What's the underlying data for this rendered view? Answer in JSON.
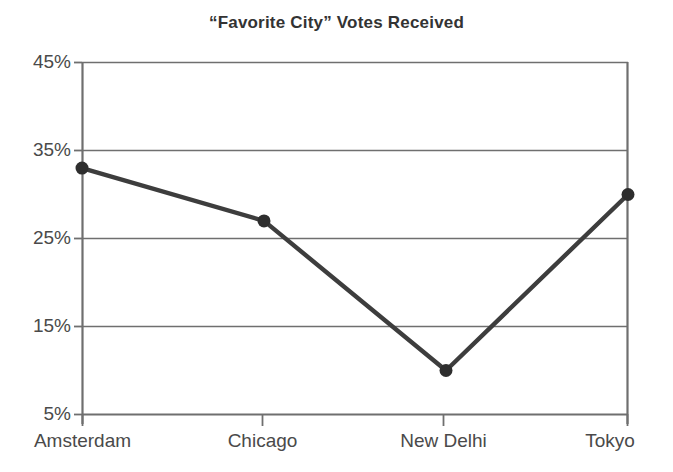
{
  "chart_data": {
    "type": "line",
    "title": "“Favorite City” Votes Received",
    "xlabel": "",
    "ylabel": "",
    "categories": [
      "Amsterdam",
      "Chicago",
      "New Delhi",
      "Tokyo"
    ],
    "values": [
      33,
      27,
      10,
      30
    ],
    "series": [
      {
        "name": "Votes Received",
        "values": [
          33,
          27,
          10,
          30
        ]
      }
    ],
    "ylim": [
      5,
      45
    ],
    "y_tick_labels": [
      "45%",
      "35%",
      "25%",
      "15%",
      "5%"
    ],
    "y_tick_values": [
      45,
      35,
      25,
      15,
      5
    ],
    "x_tick_labels": [
      "Amsterdam",
      "Chicago",
      "New Delhi",
      "Tokyo"
    ],
    "grid": true,
    "legend": "none",
    "line_color": "#3d3d3d",
    "marker_color": "#2e2e2e",
    "axis_color": "#6b6b6b",
    "grid_color": "#6f6f6f",
    "title_color": "#333333",
    "background_color": "#ffffff"
  },
  "axes": {
    "y_ticks": [
      {
        "label": "45%",
        "value": 45
      },
      {
        "label": "35%",
        "value": 35
      },
      {
        "label": "25%",
        "value": 25
      },
      {
        "label": "15%",
        "value": 15
      },
      {
        "label": "5%",
        "value": 5
      }
    ],
    "x_ticks": [
      {
        "label": "Amsterdam"
      },
      {
        "label": "Chicago"
      },
      {
        "label": "New Delhi"
      },
      {
        "label": "Tokyo"
      }
    ]
  }
}
